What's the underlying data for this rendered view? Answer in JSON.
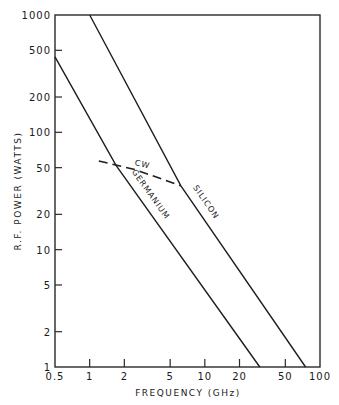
{
  "chart_data": {
    "type": "line",
    "title": "",
    "xlabel": "FREQUENCY (GHz)",
    "ylabel": "R.F. POWER (WATTS)",
    "xscale": "log",
    "yscale": "log",
    "xlim": [
      0.5,
      100
    ],
    "ylim": [
      1,
      1000
    ],
    "x_ticks": [
      0.5,
      1,
      2,
      5,
      10,
      20,
      50,
      100
    ],
    "x_tick_labels": [
      "0.5",
      "1",
      "2",
      "5",
      "10",
      "20",
      "50",
      "100"
    ],
    "y_ticks": [
      1,
      2,
      5,
      10,
      20,
      50,
      100,
      200,
      500,
      1000
    ],
    "y_tick_labels": [
      "1",
      "2",
      "5",
      "10",
      "20",
      "50",
      "100",
      "200",
      "500",
      "1000"
    ],
    "grid": false,
    "legend": "none (curves labeled inline)",
    "series": [
      {
        "name": "SILICON",
        "style": "solid",
        "points": [
          [
            1.0,
            1000
          ],
          [
            6.2,
            35
          ],
          [
            75,
            1
          ]
        ]
      },
      {
        "name": "GERMANIUM",
        "style": "solid",
        "points": [
          [
            0.5,
            440
          ],
          [
            1.7,
            52
          ],
          [
            30,
            1
          ]
        ]
      },
      {
        "name": "CW",
        "style": "dashed",
        "points": [
          [
            1.2,
            57
          ],
          [
            2.5,
            48
          ],
          [
            6.2,
            35
          ]
        ]
      }
    ]
  }
}
